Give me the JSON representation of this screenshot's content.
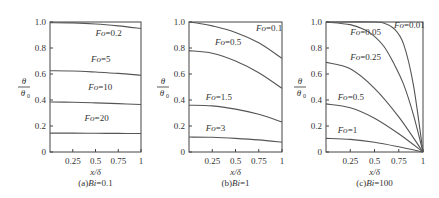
{
  "chart_data": [
    {
      "type": "line",
      "title": "(a)Bi=0.1",
      "caption_prefix": "(a)",
      "caption_var": "Bi",
      "caption_val": "=0.1",
      "xlabel": "x/δ",
      "ylabel": "θ/θ0",
      "xlim": [
        0,
        1
      ],
      "ylim": [
        0,
        1
      ],
      "xticks": [
        "0.25",
        "0.5",
        "0.75",
        "1"
      ],
      "yticks": [
        "0",
        "0.2",
        "0.4",
        "0.6",
        "0.8",
        "1.0"
      ],
      "box": {
        "x0": 50,
        "x1": 141,
        "y0": 22,
        "y1": 152
      },
      "series": [
        {
          "name": "Fo=0.2",
          "x": [
            0,
            0.25,
            0.5,
            0.75,
            1
          ],
          "y": [
            0.995,
            0.993,
            0.985,
            0.97,
            0.95
          ],
          "label_pos": [
            0.5,
            0.89
          ]
        },
        {
          "name": "Fo=5",
          "x": [
            0,
            0.25,
            0.5,
            0.75,
            1
          ],
          "y": [
            0.625,
            0.623,
            0.615,
            0.605,
            0.59
          ],
          "label_pos": [
            0.45,
            0.69
          ]
        },
        {
          "name": "Fo=10",
          "x": [
            0,
            0.25,
            0.5,
            0.75,
            1
          ],
          "y": [
            0.385,
            0.383,
            0.378,
            0.372,
            0.365
          ],
          "label_pos": [
            0.42,
            0.48
          ]
        },
        {
          "name": "Fo=20",
          "x": [
            0,
            0.25,
            0.5,
            0.75,
            1
          ],
          "y": [
            0.145,
            0.145,
            0.144,
            0.143,
            0.142
          ],
          "label_pos": [
            0.38,
            0.24
          ]
        }
      ]
    },
    {
      "type": "line",
      "title": "(b)Bi=1",
      "caption_prefix": "(b)",
      "caption_var": "Bi",
      "caption_val": "=1",
      "xlabel": "x/δ",
      "ylabel": "θ/θ0",
      "xlim": [
        0,
        1
      ],
      "ylim": [
        0,
        1
      ],
      "xticks": [
        "0.25",
        "0.5",
        "0.75",
        "1"
      ],
      "yticks": [
        "0",
        "0.2",
        "0.4",
        "0.6",
        "0.8",
        "1.0"
      ],
      "box": {
        "x0": 189,
        "x1": 282,
        "y0": 22,
        "y1": 152
      },
      "series": [
        {
          "name": "Fo=0.1",
          "x": [
            0,
            0.1,
            0.25,
            0.5,
            0.75,
            1
          ],
          "y": [
            1.0,
            0.99,
            0.97,
            0.92,
            0.84,
            0.72
          ],
          "label_pos": [
            0.72,
            0.93
          ]
        },
        {
          "name": "Fo=0.5",
          "x": [
            0,
            0.25,
            0.5,
            0.75,
            1
          ],
          "y": [
            0.78,
            0.76,
            0.7,
            0.61,
            0.49
          ],
          "label_pos": [
            0.28,
            0.82
          ]
        },
        {
          "name": "Fo=1.5",
          "x": [
            0,
            0.25,
            0.5,
            0.75,
            1
          ],
          "y": [
            0.36,
            0.355,
            0.33,
            0.29,
            0.23
          ],
          "label_pos": [
            0.18,
            0.4
          ]
        },
        {
          "name": "Fo=3",
          "x": [
            0,
            0.25,
            0.5,
            0.75,
            1
          ],
          "y": [
            0.115,
            0.113,
            0.105,
            0.093,
            0.075
          ],
          "label_pos": [
            0.18,
            0.165
          ]
        }
      ]
    },
    {
      "type": "line",
      "title": "(c)Bi=100",
      "caption_prefix": "(c)",
      "caption_var": "Bi",
      "caption_val": "=100",
      "xlabel": "x/δ",
      "ylabel": "θ/θ0",
      "xlim": [
        0,
        1
      ],
      "ylim": [
        0,
        1
      ],
      "xticks": [
        "0.25",
        "0.5",
        "0.75",
        "1"
      ],
      "yticks": [
        "0",
        "0.2",
        "0.4",
        "0.6",
        "0.8",
        "1.0"
      ],
      "box": {
        "x0": 326,
        "x1": 423,
        "y0": 22,
        "y1": 152
      },
      "series": [
        {
          "name": "Fo=0.01",
          "x": [
            0,
            0.5,
            0.6,
            0.7,
            0.8,
            0.9,
            1
          ],
          "y": [
            1.0,
            1.0,
            0.99,
            0.95,
            0.83,
            0.52,
            0.0
          ],
          "label_pos": [
            0.7,
            0.955
          ]
        },
        {
          "name": "Fo=0.05",
          "x": [
            0,
            0.25,
            0.4,
            0.5,
            0.6,
            0.7,
            0.8,
            0.9,
            1
          ],
          "y": [
            1.0,
            0.98,
            0.94,
            0.89,
            0.81,
            0.68,
            0.52,
            0.29,
            0.0
          ],
          "label_pos": [
            0.25,
            0.9
          ]
        },
        {
          "name": "Fo=0.25",
          "x": [
            0,
            0.25,
            0.5,
            0.75,
            1
          ],
          "y": [
            0.69,
            0.64,
            0.49,
            0.27,
            0.0
          ],
          "label_pos": [
            0.25,
            0.71
          ]
        },
        {
          "name": "Fo=0.5",
          "x": [
            0,
            0.25,
            0.5,
            0.75,
            1
          ],
          "y": [
            0.37,
            0.34,
            0.26,
            0.14,
            0.0
          ],
          "label_pos": [
            0.12,
            0.4
          ]
        },
        {
          "name": "Fo=1",
          "x": [
            0,
            0.25,
            0.5,
            0.75,
            1
          ],
          "y": [
            0.105,
            0.097,
            0.075,
            0.04,
            0.0
          ],
          "label_pos": [
            0.12,
            0.15
          ]
        }
      ]
    }
  ]
}
